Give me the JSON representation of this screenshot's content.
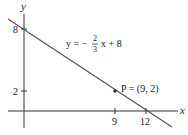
{
  "diagram": {
    "axes": {
      "x_label": "x",
      "y_label": "y",
      "x_ticks": [
        {
          "value": 9,
          "label": "9"
        },
        {
          "value": 12,
          "label": "12"
        }
      ],
      "y_ticks": [
        {
          "value": 8,
          "label": "8"
        },
        {
          "value": 2,
          "label": "2"
        }
      ]
    },
    "line": {
      "equation_lhs": "y = −",
      "frac_num": "2",
      "frac_den": "3",
      "equation_rhs": "x + 8",
      "slope": "-2/3",
      "intercept": 8,
      "x_intercept": 12
    },
    "point": {
      "label": "P = (9, 2)",
      "x": 9,
      "y": 2
    },
    "colors": {
      "axis": "#333333",
      "line": "#555555",
      "text": "#222222"
    }
  }
}
